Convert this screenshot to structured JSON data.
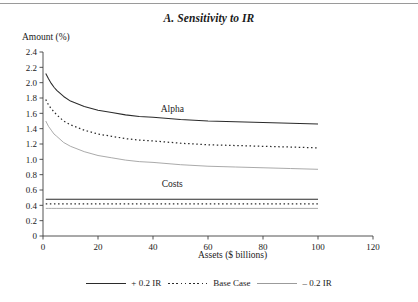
{
  "figure": {
    "title": "A. Sensitivity to IR",
    "y_axis_caption": "Amount (%)",
    "x_axis_caption": "Assets ($ billions)"
  },
  "legend": {
    "position": "bottom-center",
    "items": [
      {
        "label": "+ 0.2 IR",
        "style": "solid",
        "color": "#2b2b2b",
        "swatch": "swatch-solid-dark"
      },
      {
        "label": "Base Case",
        "style": "dotted",
        "color": "#2b2b2b",
        "swatch": "swatch-dotted"
      },
      {
        "label": "– 0.2 IR",
        "style": "solid",
        "color": "#9b9b9b",
        "swatch": "swatch-solid-light"
      }
    ]
  },
  "annotations": [
    {
      "name": "alpha-group-label",
      "text": "Alpha",
      "x": 47,
      "y": 1.62
    },
    {
      "name": "costs-group-label",
      "text": "Costs",
      "x": 47,
      "y": 0.64
    }
  ],
  "chart_data": {
    "type": "line",
    "title": "A. Sensitivity to IR",
    "xlabel": "Assets ($ billions)",
    "ylabel": "Amount (%)",
    "xlim": [
      0,
      120
    ],
    "ylim": [
      0,
      2.4
    ],
    "xticks": [
      0,
      20,
      40,
      60,
      80,
      100,
      120
    ],
    "xtick_labels": [
      "0",
      "20",
      "40",
      "60",
      "80",
      "100",
      "120"
    ],
    "yticks": [
      0,
      0.2,
      0.4,
      0.6,
      0.8,
      1.0,
      1.2,
      1.4,
      1.6,
      1.8,
      2.0,
      2.2,
      2.4
    ],
    "ytick_labels": [
      "0",
      "0.2",
      "0.4",
      "0.6",
      "0.8",
      "1.0",
      "1.2",
      "1.4",
      "1.6",
      "1.8",
      "2.0",
      "2.2",
      "2.4"
    ],
    "grid": false,
    "legend_position": "bottom-center",
    "x": [
      1,
      2,
      3,
      4,
      5,
      7.5,
      10,
      15,
      20,
      25,
      30,
      35,
      40,
      50,
      60,
      70,
      80,
      90,
      100
    ],
    "series": [
      {
        "name": "Alpha, + 0.2 IR",
        "group": "Alpha",
        "style": "solid",
        "color": "#2b2b2b",
        "values": [
          2.12,
          2.05,
          1.99,
          1.94,
          1.9,
          1.82,
          1.76,
          1.69,
          1.64,
          1.61,
          1.58,
          1.56,
          1.55,
          1.52,
          1.5,
          1.49,
          1.48,
          1.47,
          1.46
        ]
      },
      {
        "name": "Alpha, Base Case",
        "group": "Alpha",
        "style": "dotted",
        "color": "#2b2b2b",
        "values": [
          1.78,
          1.71,
          1.66,
          1.62,
          1.58,
          1.5,
          1.45,
          1.38,
          1.33,
          1.3,
          1.27,
          1.25,
          1.24,
          1.21,
          1.19,
          1.18,
          1.17,
          1.16,
          1.15
        ]
      },
      {
        "name": "Alpha, – 0.2 IR",
        "group": "Alpha",
        "style": "solid",
        "color": "#9b9b9b",
        "values": [
          1.5,
          1.43,
          1.38,
          1.33,
          1.3,
          1.22,
          1.17,
          1.1,
          1.05,
          1.02,
          0.99,
          0.97,
          0.96,
          0.93,
          0.91,
          0.9,
          0.89,
          0.88,
          0.87
        ]
      },
      {
        "name": "Costs, + 0.2 IR",
        "group": "Costs",
        "style": "solid",
        "color": "#2b2b2b",
        "values": [
          0.48,
          0.48,
          0.48,
          0.48,
          0.48,
          0.48,
          0.48,
          0.48,
          0.48,
          0.48,
          0.48,
          0.48,
          0.48,
          0.48,
          0.48,
          0.48,
          0.48,
          0.48,
          0.48
        ]
      },
      {
        "name": "Costs, Base Case",
        "group": "Costs",
        "style": "dotted",
        "color": "#2b2b2b",
        "values": [
          0.42,
          0.42,
          0.42,
          0.42,
          0.42,
          0.42,
          0.42,
          0.42,
          0.42,
          0.42,
          0.42,
          0.42,
          0.42,
          0.42,
          0.42,
          0.42,
          0.42,
          0.42,
          0.42
        ]
      },
      {
        "name": "Costs, – 0.2 IR",
        "group": "Costs",
        "style": "solid",
        "color": "#9b9b9b",
        "values": [
          0.36,
          0.36,
          0.36,
          0.36,
          0.36,
          0.36,
          0.36,
          0.36,
          0.36,
          0.36,
          0.36,
          0.36,
          0.36,
          0.36,
          0.36,
          0.36,
          0.36,
          0.36,
          0.36
        ]
      }
    ]
  }
}
